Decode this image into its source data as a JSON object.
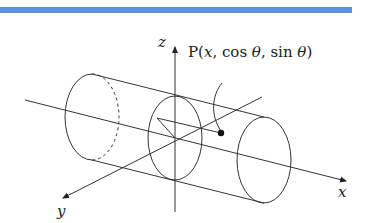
{
  "header_bar": {
    "color": "#5b93e0"
  },
  "diagram": {
    "axes": {
      "x_label": "x",
      "y_label": "y",
      "z_label": "z"
    },
    "point": {
      "label_prefix": "P(",
      "label_x": "x",
      "label_mid1": ", cos ",
      "label_theta1": "θ",
      "label_mid2": ", sin ",
      "label_theta2": "θ",
      "label_suffix": ")"
    },
    "colors": {
      "line": "#333333",
      "point": "#111111"
    }
  }
}
